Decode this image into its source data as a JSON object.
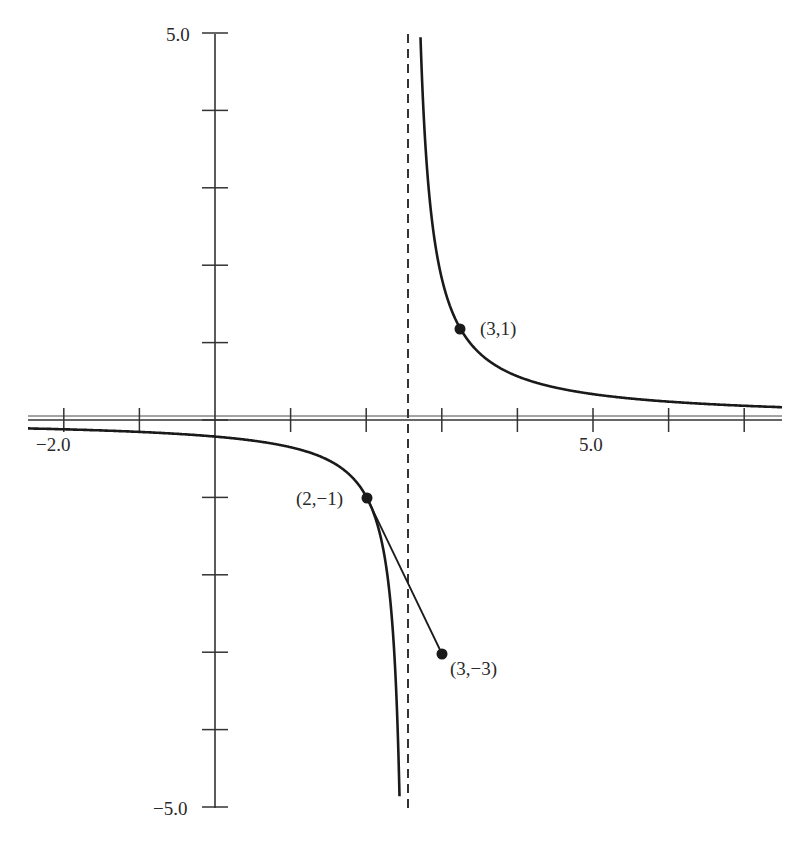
{
  "chart_data": {
    "type": "line",
    "title": "",
    "xlabel": "",
    "ylabel": "",
    "xlim": [
      -2.5,
      7.5
    ],
    "ylim": [
      -5.0,
      5.0
    ],
    "grid": false,
    "legend": null,
    "x_tick_labels": [
      {
        "value": -2.0,
        "label": "−2.0"
      },
      {
        "value": 5.0,
        "label": "5.0"
      }
    ],
    "y_tick_labels": [
      {
        "value": 5.0,
        "label": "5.0"
      },
      {
        "value": -5.0,
        "label": "−5.0"
      }
    ],
    "x_ticks": [
      -2,
      -1,
      0,
      1,
      2,
      3,
      4,
      5,
      6,
      7
    ],
    "y_ticks": [
      -5,
      -4,
      -3,
      -2,
      -1,
      0,
      1,
      2,
      3,
      4,
      5
    ],
    "vertical_asymptote": {
      "x": 2.5,
      "style": "dashed"
    },
    "horizontal_asymptote": {
      "y": 0
    },
    "series": [
      {
        "name": "hyperbola-right-branch",
        "kind": "curve",
        "description": "decreasing branch right of asymptote, through (3,1)"
      },
      {
        "name": "hyperbola-left-branch",
        "kind": "curve",
        "description": "decreasing branch left of asymptote, through (2,-1)"
      },
      {
        "name": "secant-segment",
        "kind": "segment",
        "points": [
          [
            2,
            -1
          ],
          [
            3,
            -3
          ]
        ]
      }
    ],
    "points": [
      {
        "x": 3,
        "y": 1,
        "label": "(3,1)"
      },
      {
        "x": 2,
        "y": -1,
        "label": "(2,−1)"
      },
      {
        "x": 3,
        "y": -3,
        "label": "(3,−3)"
      }
    ]
  },
  "colors": {
    "ink": "#1a1a1a",
    "axis": "#333333",
    "background": "#ffffff"
  }
}
